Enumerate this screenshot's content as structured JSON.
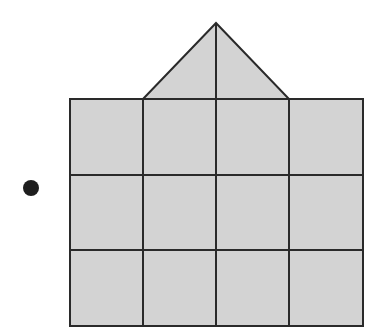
{
  "figure": {
    "colors": {
      "fill": "#d3d3d3",
      "stroke": "#2a2a2a",
      "dot": "#1e1e1e",
      "background": "#ffffff"
    },
    "grid": {
      "columns": 4,
      "rows": 3,
      "x_lines": [
        70,
        143,
        216,
        289,
        363
      ],
      "y_lines": [
        99,
        175,
        250,
        326
      ]
    },
    "roof": {
      "apex": [
        216,
        23
      ],
      "base_left": [
        143,
        99
      ],
      "base_right": [
        289,
        99
      ],
      "center_line": true
    },
    "dot": {
      "cx": 31,
      "cy": 188,
      "r": 8
    }
  }
}
